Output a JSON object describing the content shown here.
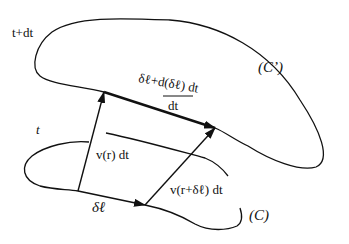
{
  "diagram": {
    "labels": {
      "time_upper": "t+dt",
      "time_lower": "t",
      "curve_upper": "(C’)",
      "curve_lower": "(C)",
      "delta_l": "δℓ",
      "v_r": "v(r) dt",
      "v_r_dl": "v(r+δℓ) dt",
      "numerator": "δℓ+d(δℓ) dt",
      "denominator": "dt"
    },
    "colors": {
      "stroke": "#111111",
      "background": "#ffffff"
    }
  }
}
